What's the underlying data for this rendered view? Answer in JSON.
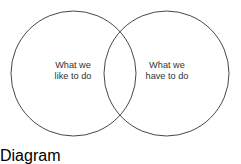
{
  "diagram": {
    "type": "venn-2-set",
    "width": 241,
    "height": 147,
    "background_color": "#ffffff",
    "stroke_color": "#474747",
    "text_color": "#333333",
    "sets": [
      {
        "id": "left",
        "name": "what-we-like-to-do",
        "label_lines": [
          "What we",
          "like to do"
        ],
        "center_x": 73.5,
        "center_y": 73.5,
        "radius": 62.5,
        "label_x": 73,
        "label_y": 71
      },
      {
        "id": "right",
        "name": "what-we-have-to-do",
        "label_lines": [
          "What we",
          "have to do"
        ],
        "center_x": 166.5,
        "center_y": 73.5,
        "radius": 62.5,
        "label_x": 167,
        "label_y": 71
      }
    ],
    "intersection": {
      "label_lines": [],
      "top_crossing_x": 120,
      "top_crossing_y": 28,
      "bottom_crossing_x": 120,
      "bottom_crossing_y": 118
    }
  }
}
